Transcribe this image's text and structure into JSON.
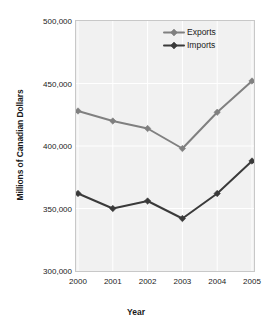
{
  "chart_data": {
    "type": "line",
    "title": "",
    "xlabel": "Year",
    "ylabel": "Millions of Canadian Dollars",
    "categories": [
      "2000",
      "2001",
      "2002",
      "2003",
      "2004",
      "2005"
    ],
    "x": [
      2000,
      2001,
      2002,
      2003,
      2004,
      2005
    ],
    "ylim": [
      300000,
      500000
    ],
    "yticks": [
      300000,
      350000,
      400000,
      450000,
      500000
    ],
    "ytick_labels": [
      "300,000",
      "350,000",
      "400,000",
      "450,000",
      "500,000"
    ],
    "grid": "vertical-and-horizontal",
    "legend_position": "top-right-inside",
    "series": [
      {
        "name": "Exports",
        "color": "#808080",
        "marker": "diamond",
        "values": [
          428000,
          420000,
          414000,
          398000,
          427000,
          452000
        ]
      },
      {
        "name": "Imports",
        "color": "#3a3a3a",
        "marker": "diamond",
        "values": [
          362000,
          350000,
          356000,
          342000,
          362000,
          388000
        ]
      }
    ]
  },
  "colors": {
    "plot_background": "#f1f1f1",
    "plot_border": "#c8c8c8",
    "gridline": "#ffffff",
    "text": "#1a1a1a",
    "page_background": "#ffffff"
  }
}
